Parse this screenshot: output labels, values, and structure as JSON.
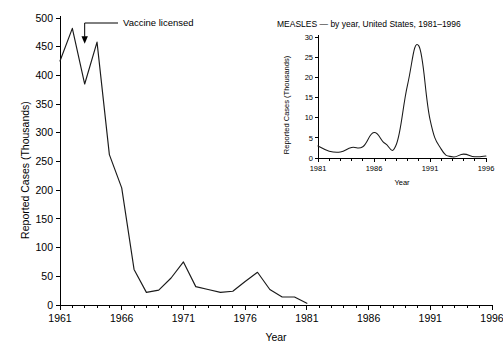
{
  "chart_data": [
    {
      "id": "main",
      "type": "line",
      "title": "",
      "xlabel": "Year",
      "ylabel": "Reported Cases (Thousands)",
      "xlim": [
        1961,
        1996
      ],
      "ylim": [
        0,
        500
      ],
      "yticks": [
        0,
        50,
        100,
        150,
        200,
        250,
        300,
        350,
        400,
        450,
        500
      ],
      "xticks_major": [
        1961,
        1966,
        1971,
        1976,
        1981,
        1986,
        1991,
        1996
      ],
      "xtick_minor_step": 1,
      "grid": false,
      "legend": "none",
      "x": [
        1961,
        1962,
        1963,
        1964,
        1965,
        1966,
        1967,
        1968,
        1969,
        1970,
        1971,
        1972,
        1973,
        1974,
        1975,
        1976,
        1977,
        1978,
        1979,
        1980,
        1981
      ],
      "values": [
        425,
        482,
        385,
        458,
        262,
        204,
        62,
        22,
        26,
        47,
        75,
        32,
        27,
        22,
        24,
        41,
        57,
        27,
        14,
        14,
        3
      ],
      "annotations": [
        {
          "text": "Vaccine licensed",
          "target_x": 1963,
          "target_y": 455
        }
      ]
    },
    {
      "id": "inset",
      "type": "line",
      "title": "MEASLES — by year, United States, 1981–1996",
      "xlabel": "Year",
      "ylabel": "Reported Cases (Thousands)",
      "xlim": [
        1981,
        1996
      ],
      "ylim": [
        0,
        30
      ],
      "yticks": [
        0,
        5,
        10,
        15,
        20,
        25,
        30
      ],
      "xticks_major": [
        1981,
        1986,
        1991,
        1996
      ],
      "xtick_minor_step": 1,
      "grid": false,
      "legend": "none",
      "x": [
        1981,
        1982,
        1983,
        1984,
        1985,
        1986,
        1987,
        1988,
        1989,
        1990,
        1991,
        1992,
        1993,
        1994,
        1995,
        1996
      ],
      "values": [
        3.0,
        1.7,
        1.5,
        2.6,
        2.8,
        6.3,
        3.6,
        3.4,
        18.2,
        27.8,
        9.6,
        2.2,
        0.3,
        0.96,
        0.31,
        0.5
      ]
    }
  ],
  "colors": {
    "line": "#1a1a1a",
    "axis": "#000000",
    "background": "#ffffff"
  }
}
